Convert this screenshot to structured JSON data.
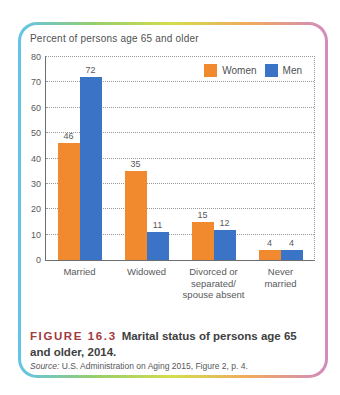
{
  "figure": {
    "label": "FIGURE 16.3",
    "caption": "Marital status of persons age 65 and older, 2014.",
    "source_prefix": "Source:",
    "source_text": "U.S. Administration on Aging 2015, Figure 2, p. 4."
  },
  "chart_data": {
    "type": "bar",
    "title": "Percent of persons age 65 and older",
    "categories": [
      "Married",
      "Widowed",
      "Divorced or\nseparated/\nspouse absent",
      "Never\nmarried"
    ],
    "series": [
      {
        "name": "Women",
        "color": "#F1892E",
        "values": [
          46,
          35,
          15,
          4
        ]
      },
      {
        "name": "Men",
        "color": "#3B74C6",
        "values": [
          72,
          11,
          12,
          4
        ]
      }
    ],
    "ylim": [
      0,
      80
    ],
    "ytick_step": 10,
    "grid": "dotted-horizontal",
    "legend_position": "top-right"
  },
  "colors": {
    "women": "#F1892E",
    "men": "#3B74C6",
    "figure_label": "#A13B3E",
    "axis_text": "#58595b",
    "border_gradient": [
      "#62C4E8",
      "#96CE6B",
      "#D5DC4C",
      "#EFA95F",
      "#D38ABE"
    ]
  }
}
